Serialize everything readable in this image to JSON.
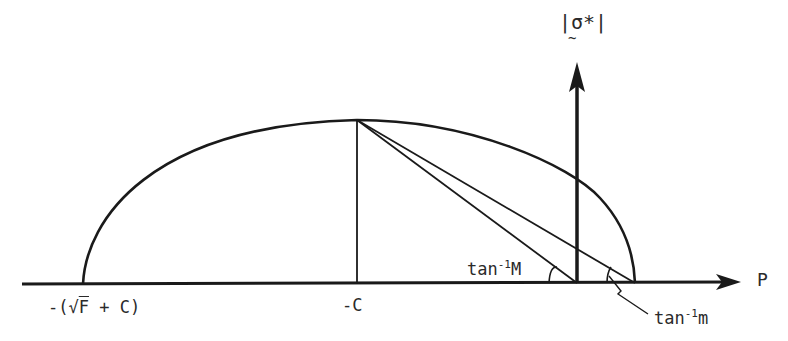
{
  "diagram": {
    "title": "",
    "axes": {
      "horizontal_label": "P",
      "vertical_label": "|σ*|",
      "vertical_label_tilde": "~"
    },
    "labels": {
      "left_intercept": {
        "prefix": "-(",
        "radical": "√",
        "radicand": "F",
        "suffix": " + C)"
      },
      "center": "-C",
      "angle_M": {
        "base": "tan",
        "exp": "-1",
        "arg": "M"
      },
      "angle_m": {
        "base": "tan",
        "exp": "-1",
        "arg": "m"
      }
    },
    "colors": {
      "ink": "#1a1a1a",
      "background": "#ffffff"
    }
  }
}
